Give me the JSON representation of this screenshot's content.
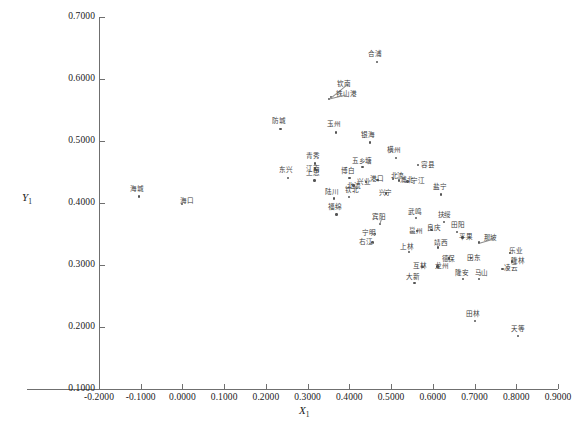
{
  "chart_data": {
    "type": "scatter",
    "title": "",
    "xlabel": "X1",
    "ylabel": "Y1",
    "xlim": [
      -0.2,
      0.9
    ],
    "ylim": [
      0.1,
      0.7
    ],
    "xticks": [
      "-0.2000",
      "-0.1000",
      "0.0000",
      "0.1000",
      "0.2000",
      "0.3000",
      "0.4000",
      "0.5000",
      "0.6000",
      "0.7000",
      "0.8000",
      "0.9000"
    ],
    "xtick_values": [
      -0.2,
      -0.1,
      0.0,
      0.1,
      0.2,
      0.3,
      0.4,
      0.5,
      0.6,
      0.7,
      0.8,
      0.9
    ],
    "yticks": [
      "0.1000",
      "0.2000",
      "0.3000",
      "0.4000",
      "0.5000",
      "0.6000",
      "0.7000"
    ],
    "ytick_values": [
      0.1,
      0.2,
      0.3,
      0.4,
      0.5,
      0.6,
      0.7
    ],
    "grid": false,
    "legend": null,
    "marker": "dot",
    "points": [
      {
        "label": "合浦",
        "x": 0.467,
        "y": 0.627,
        "lx": -9,
        "ly": -11
      },
      {
        "label": "钦南",
        "x": 0.356,
        "y": 0.57,
        "lx": 6,
        "ly": -17,
        "leader": true
      },
      {
        "label": "铁山港",
        "x": 0.352,
        "y": 0.567,
        "lx": 7,
        "ly": -8,
        "leader": true
      },
      {
        "label": "防城",
        "x": 0.236,
        "y": 0.519,
        "lx": -9,
        "ly": -11
      },
      {
        "label": "玉州",
        "x": 0.369,
        "y": 0.513,
        "lx": -9,
        "ly": -12
      },
      {
        "label": "银海",
        "x": 0.45,
        "y": 0.497,
        "lx": -9,
        "ly": -11
      },
      {
        "label": "横州",
        "x": 0.512,
        "y": 0.472,
        "lx": -9,
        "ly": -11
      },
      {
        "label": "青秀",
        "x": 0.318,
        "y": 0.463,
        "lx": -9,
        "ly": -11
      },
      {
        "label": "江南",
        "x": 0.318,
        "y": 0.455,
        "lx": -9,
        "ly": -3
      },
      {
        "label": "容县",
        "x": 0.565,
        "y": 0.461,
        "lx": 3,
        "ly": -3
      },
      {
        "label": "五乡塘",
        "x": 0.432,
        "y": 0.458,
        "lx": -11,
        "ly": -9
      },
      {
        "label": "东兴",
        "x": 0.253,
        "y": 0.44,
        "lx": -9,
        "ly": -11
      },
      {
        "label": "上思",
        "x": 0.317,
        "y": 0.436,
        "lx": -9,
        "ly": -11
      },
      {
        "label": "博白",
        "x": 0.401,
        "y": 0.44,
        "lx": -9,
        "ly": -10
      },
      {
        "label": "兴业",
        "x": 0.44,
        "y": 0.433,
        "lx": -9,
        "ly": -4
      },
      {
        "label": "港口",
        "x": 0.468,
        "y": 0.437,
        "lx": -8,
        "ly": -4
      },
      {
        "label": "北流",
        "x": 0.506,
        "y": 0.438,
        "lx": -3,
        "ly": -6
      },
      {
        "label": "浦北",
        "x": 0.52,
        "y": 0.436,
        "lx": 1,
        "ly": -4
      },
      {
        "label": "宁江",
        "x": 0.54,
        "y": 0.434,
        "lx": 3,
        "ly": -4
      },
      {
        "label": "北流2",
        "x": 0.411,
        "y": 0.428,
        "lx": -7,
        "ly": -3
      },
      {
        "label": "兴宁",
        "x": 0.489,
        "y": 0.415,
        "lx": -8,
        "ly": -4
      },
      {
        "label": "海城",
        "x": -0.104,
        "y": 0.41,
        "lx": -9,
        "ly": -11
      },
      {
        "label": "海口",
        "x": 0.0,
        "y": 0.398,
        "lx": -2,
        "ly": -6
      },
      {
        "label": "陆川",
        "x": 0.364,
        "y": 0.407,
        "lx": -9,
        "ly": -10
      },
      {
        "label": "钦北",
        "x": 0.4,
        "y": 0.409,
        "lx": -4,
        "ly": -10
      },
      {
        "label": "盐宁",
        "x": 0.62,
        "y": 0.413,
        "lx": -8,
        "ly": -11
      },
      {
        "label": "福绵",
        "x": 0.37,
        "y": 0.381,
        "lx": -9,
        "ly": -11
      },
      {
        "label": "宾阳",
        "x": 0.474,
        "y": 0.366,
        "lx": -8,
        "ly": -10,
        "leader": true
      },
      {
        "label": "武鸣",
        "x": 0.56,
        "y": 0.375,
        "lx": -8,
        "ly": -10
      },
      {
        "label": "扶绥",
        "x": 0.628,
        "y": 0.369,
        "lx": -7,
        "ly": -10
      },
      {
        "label": "宁明",
        "x": 0.462,
        "y": 0.35,
        "lx": -13,
        "ly": -4,
        "leader": true
      },
      {
        "label": "邕州",
        "x": 0.563,
        "y": 0.354,
        "lx": -8,
        "ly": -4
      },
      {
        "label": "良庆",
        "x": 0.598,
        "y": 0.356,
        "lx": -5,
        "ly": -5
      },
      {
        "label": "田阳",
        "x": 0.659,
        "y": 0.353,
        "lx": -6,
        "ly": -10
      },
      {
        "label": "平果",
        "x": 0.672,
        "y": 0.344,
        "lx": -4,
        "ly": -4
      },
      {
        "label": "右江",
        "x": 0.456,
        "y": 0.336,
        "lx": -14,
        "ly": -4,
        "leader": true
      },
      {
        "label": "靖西",
        "x": 0.613,
        "y": 0.328,
        "lx": -4,
        "ly": -8
      },
      {
        "label": "那坡",
        "x": 0.712,
        "y": 0.336,
        "lx": 4,
        "ly": -8,
        "leader": true
      },
      {
        "label": "上林",
        "x": 0.544,
        "y": 0.32,
        "lx": -9,
        "ly": -9
      },
      {
        "label": "德保",
        "x": 0.64,
        "y": 0.31,
        "lx": -8,
        "ly": -3
      },
      {
        "label": "田东",
        "x": 0.692,
        "y": 0.311,
        "lx": -4,
        "ly": -3
      },
      {
        "label": "乐业",
        "x": 0.785,
        "y": 0.319,
        "lx": -1,
        "ly": -5
      },
      {
        "label": "隆林",
        "x": 0.79,
        "y": 0.305,
        "lx": -1,
        "ly": -4
      },
      {
        "label": "互林",
        "x": 0.576,
        "y": 0.296,
        "lx": -10,
        "ly": -4
      },
      {
        "label": "龙州",
        "x": 0.612,
        "y": 0.297,
        "lx": -3,
        "ly": -4
      },
      {
        "label": "凌云",
        "x": 0.768,
        "y": 0.293,
        "lx": 1,
        "ly": -4
      },
      {
        "label": "大新",
        "x": 0.557,
        "y": 0.27,
        "lx": -9,
        "ly": -10
      },
      {
        "label": "隆安",
        "x": 0.673,
        "y": 0.277,
        "lx": -8,
        "ly": -9
      },
      {
        "label": "马山",
        "x": 0.712,
        "y": 0.277,
        "lx": -5,
        "ly": -9
      },
      {
        "label": "田林",
        "x": 0.702,
        "y": 0.209,
        "lx": -9,
        "ly": -10
      },
      {
        "label": "天等",
        "x": 0.805,
        "y": 0.185,
        "lx": -7,
        "ly": -10
      }
    ]
  },
  "axes": {
    "x_title_main": "X",
    "x_title_sub": "1",
    "y_title_main": "Y",
    "y_title_sub": "1"
  }
}
